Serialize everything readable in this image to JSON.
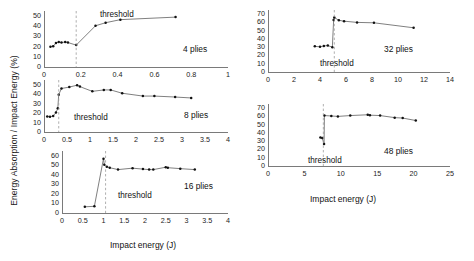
{
  "figure": {
    "ylabel": "Energy Absorption / Impact Energy (%)",
    "xlabel_left": "Impact energy (J)",
    "xlabel_right": "Impact energy (J)",
    "threshold_label": "threshold",
    "line_color": "#555555",
    "point_color": "#111111",
    "threshold_color": "#9a9a9a",
    "axis_color": "#7a7a7a"
  },
  "chart_data": [
    {
      "type": "line",
      "title": "4 plies",
      "xlabel": "Impact energy (J)",
      "ylabel": "Energy Absorption / Impact Energy (%)",
      "xlim": [
        0,
        1.0
      ],
      "ylim": [
        0,
        55
      ],
      "xticks": [
        0,
        0.2,
        0.4,
        0.6,
        0.8,
        1
      ],
      "xticklabels": [
        "0",
        "0.2",
        "0.4",
        "0.6",
        "0.8",
        "1"
      ],
      "yticks": [
        0,
        10,
        20,
        30,
        40,
        50
      ],
      "yticklabels": [
        "0",
        "10",
        "20",
        "30",
        "40",
        "50"
      ],
      "grid": false,
      "threshold": 0.175,
      "threshold_label": "threshold",
      "x": [
        0.035,
        0.05,
        0.065,
        0.08,
        0.095,
        0.115,
        0.13,
        0.175,
        0.28,
        0.335,
        0.415,
        0.715
      ],
      "y": [
        20.0,
        20.5,
        23.5,
        24.5,
        24.0,
        24.5,
        24.0,
        21.5,
        40.5,
        43.5,
        46.5,
        49.0
      ]
    },
    {
      "type": "line",
      "title": "8 plies",
      "xlabel": "Impact energy (J)",
      "ylabel": "Energy Absorption / Impact Energy (%)",
      "xlim": [
        0,
        4.0
      ],
      "ylim": [
        0,
        55
      ],
      "xticks": [
        0,
        0.5,
        1,
        1.5,
        2,
        2.5,
        3,
        3.5,
        4
      ],
      "xticklabels": [
        "0",
        "0.5",
        "1",
        "1.5",
        "2",
        "2.5",
        "3",
        "3.5",
        "4"
      ],
      "yticks": [
        0,
        10,
        20,
        30,
        40,
        50
      ],
      "yticklabels": [
        "0",
        "10",
        "20",
        "30",
        "40",
        "50"
      ],
      "grid": false,
      "threshold": 0.32,
      "threshold_label": "threshold",
      "x": [
        0.07,
        0.13,
        0.2,
        0.26,
        0.3,
        0.32,
        0.38,
        0.55,
        0.72,
        0.78,
        1.05,
        1.3,
        1.45,
        1.7,
        2.15,
        2.4,
        2.85,
        3.2
      ],
      "y": [
        16.5,
        16.0,
        17.0,
        20.5,
        25.0,
        39.5,
        46.0,
        47.5,
        49.5,
        48.0,
        43.0,
        44.5,
        44.5,
        41.0,
        38.0,
        38.0,
        37.0,
        36.0
      ]
    },
    {
      "type": "line",
      "title": "16 plies",
      "xlabel": "Impact energy (J)",
      "ylabel": "Energy Absorption / Impact Energy (%)",
      "xlim": [
        0,
        4.0
      ],
      "ylim": [
        0,
        65
      ],
      "xticks": [
        0,
        0.5,
        1,
        1.5,
        2,
        2.5,
        3,
        3.5,
        4
      ],
      "xticklabels": [
        "0",
        "0.5",
        "1",
        "1.5",
        "2",
        "2.5",
        "3",
        "3.5",
        "4"
      ],
      "yticks": [
        0,
        10,
        20,
        30,
        40,
        50,
        60
      ],
      "yticklabels": [
        "0",
        "10",
        "20",
        "30",
        "40",
        "50",
        "60"
      ],
      "grid": false,
      "threshold": 1.05,
      "threshold_label": "threshold",
      "x": [
        0.55,
        0.78,
        1.0,
        1.02,
        1.08,
        1.15,
        1.35,
        1.7,
        1.95,
        2.1,
        2.2,
        2.5,
        2.55,
        2.85,
        3.2
      ],
      "y": [
        6.5,
        7.0,
        57.0,
        50.5,
        48.5,
        47.5,
        45.5,
        47.0,
        46.0,
        45.5,
        45.5,
        48.0,
        47.5,
        46.5,
        45.5
      ]
    },
    {
      "type": "line",
      "title": "32 plies",
      "xlabel": "Impact energy (J)",
      "ylabel": "Energy Absorption / Impact Energy (%)",
      "xlim": [
        0,
        14
      ],
      "ylim": [
        0,
        75
      ],
      "xticks": [
        0,
        2,
        4,
        6,
        8,
        10,
        12,
        14
      ],
      "xticklabels": [
        "0",
        "2",
        "4",
        "6",
        "8",
        "10",
        "12",
        "14"
      ],
      "yticks": [
        0,
        10,
        20,
        30,
        40,
        50,
        60,
        70
      ],
      "yticklabels": [
        "0",
        "10",
        "20",
        "30",
        "40",
        "50",
        "60",
        "70"
      ],
      "grid": false,
      "threshold": 5.1,
      "threshold_label": "threshold",
      "x": [
        3.6,
        4.0,
        4.3,
        4.6,
        4.95,
        5.05,
        5.1,
        5.45,
        5.85,
        6.85,
        8.15,
        11.2
      ],
      "y": [
        31.0,
        30.5,
        31.5,
        32.0,
        30.0,
        63.0,
        66.0,
        62.5,
        61.5,
        60.0,
        59.5,
        53.5
      ]
    },
    {
      "type": "line",
      "title": "48 plies",
      "xlabel": "Impact energy (J)",
      "ylabel": "Energy Absorption / Impact Energy (%)",
      "xlim": [
        0,
        25
      ],
      "ylim": [
        0,
        75
      ],
      "xticks": [
        0,
        5,
        10,
        15,
        20,
        25
      ],
      "xticklabels": [
        "0",
        "5",
        "10",
        "15",
        "20",
        "25"
      ],
      "yticks": [
        0,
        10,
        20,
        30,
        40,
        50,
        60,
        70
      ],
      "yticklabels": [
        "0",
        "10",
        "20",
        "30",
        "40",
        "50",
        "60",
        "70"
      ],
      "grid": false,
      "threshold": 7.6,
      "threshold_label": "threshold",
      "x": [
        7.2,
        7.45,
        7.7,
        7.75,
        8.7,
        9.6,
        11.3,
        13.7,
        14.0,
        15.4,
        17.4,
        18.5,
        20.3
      ],
      "y": [
        34.5,
        34.0,
        26.5,
        61.0,
        60.5,
        60.0,
        61.0,
        62.0,
        61.5,
        61.0,
        58.5,
        58.0,
        55.0
      ]
    }
  ]
}
